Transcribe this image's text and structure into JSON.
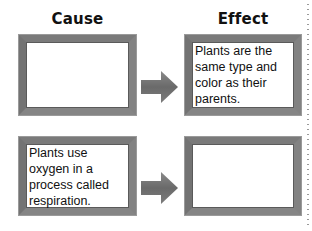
{
  "headers": {
    "cause": "Cause",
    "effect": "Effect"
  },
  "rows": [
    {
      "cause": "",
      "effect": "Plants are the same type and color as their parents."
    },
    {
      "cause": "Plants use oxygen in a process called respiration.",
      "effect": ""
    }
  ],
  "icons": {
    "arrow": "right-arrow-icon"
  },
  "colors": {
    "frame": "#6e6e6e",
    "arrow": "#6b6b6b",
    "text": "#111111",
    "dots": "#9a9a9a"
  }
}
